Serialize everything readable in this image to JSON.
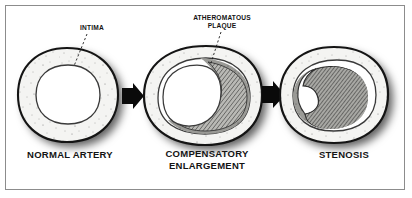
{
  "figure": {
    "background_color": "#ffffff",
    "frame_color": "#8c8c8c",
    "ink_color": "#141414"
  },
  "callouts": [
    {
      "id": "intima",
      "text": "INTIMA",
      "leader": "dashed",
      "points_to": "inner lining of normal artery lumen"
    },
    {
      "id": "atheromatous-plaque",
      "text": "ATHEROMATOUS\nPLAQUE",
      "leader": "dashed",
      "points_to": "hatched plaque mass in compensatory enlargement vessel"
    }
  ],
  "stages": [
    {
      "id": "normal-artery",
      "label": "NORMAL ARTERY",
      "order": 1,
      "lumen": "open, round, unobstructed",
      "plaque": "none",
      "wall_texture": "stippled",
      "outer_shape": "round"
    },
    {
      "id": "compensatory-enlargement",
      "label": "COMPENSATORY\nENLARGEMENT",
      "order": 2,
      "lumen": "preserved, shifted left",
      "plaque": "crescent of hatched atheroma along right wall",
      "wall_texture": "stippled",
      "outer_shape": "enlarged oval"
    },
    {
      "id": "stenosis",
      "label": "STENOSIS",
      "order": 3,
      "lumen": "narrowed to a small crescent on the left",
      "plaque": "large hatched atheroma filling most of lumen",
      "wall_texture": "stippled",
      "outer_shape": "oval"
    }
  ],
  "arrows": [
    {
      "id": "arrow-1",
      "from": "normal-artery",
      "to": "compensatory-enlargement",
      "direction": "right",
      "style": "solid-block"
    },
    {
      "id": "arrow-2",
      "from": "compensatory-enlargement",
      "to": "stenosis",
      "direction": "right",
      "style": "solid-block"
    }
  ]
}
